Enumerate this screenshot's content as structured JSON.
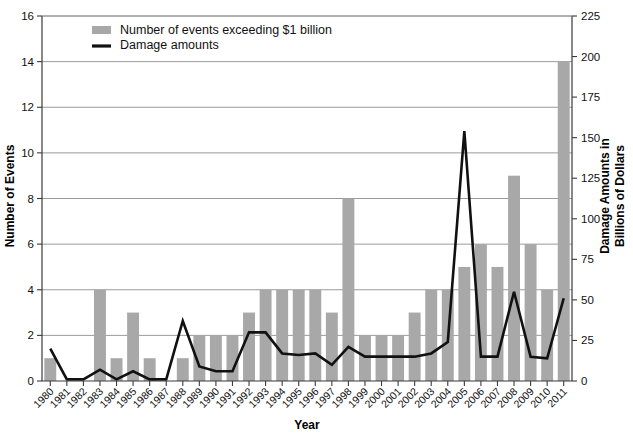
{
  "chart_data": {
    "type": "bar",
    "title": "",
    "subtitle": "",
    "xlabel": "Year",
    "ylabel": "Number of Events",
    "y2label": "Damage Amounts in Billions of Dollars",
    "grid": true,
    "legend_position": "top-left-inside",
    "ylim": [
      0,
      16
    ],
    "y2lim": [
      0,
      225
    ],
    "yticks": [
      0,
      2,
      4,
      6,
      8,
      10,
      12,
      14,
      16
    ],
    "y2ticks": [
      0,
      25,
      50,
      75,
      100,
      125,
      150,
      175,
      200,
      225
    ],
    "categories": [
      "1980",
      "1981",
      "1982",
      "1983",
      "1984",
      "1985",
      "1986",
      "1987",
      "1988",
      "1989",
      "1990",
      "1991",
      "1992",
      "1993",
      "1994",
      "1995",
      "1996",
      "1997",
      "1998",
      "1999",
      "2000",
      "2001",
      "2002",
      "2003",
      "2004",
      "2005",
      "2006",
      "2007",
      "2008",
      "2009",
      "2010",
      "2011"
    ],
    "series": [
      {
        "name": "Number of events exceeding $1 billion",
        "type": "bar",
        "axis": "left",
        "color": "#a8a8a8",
        "values": [
          1,
          0,
          0,
          4,
          1,
          3,
          1,
          0,
          1,
          2,
          2,
          2,
          3,
          4,
          4,
          4,
          4,
          3,
          8,
          2,
          2,
          2,
          3,
          4,
          4,
          5,
          6,
          5,
          9,
          6,
          4,
          14
        ]
      },
      {
        "name": "Damage amounts",
        "type": "line",
        "axis": "right",
        "color": "#111111",
        "values": [
          20,
          1,
          1,
          7,
          1,
          6,
          1,
          1,
          37,
          9,
          6,
          6,
          30,
          30,
          17,
          16,
          17,
          10,
          21,
          15,
          15,
          15,
          15,
          17,
          24,
          154,
          15,
          15,
          55,
          15,
          14,
          51
        ]
      }
    ]
  },
  "legend": {
    "items": [
      {
        "label": "Number of events exceeding $1 billion",
        "marker": "bar-swatch"
      },
      {
        "label": "Damage amounts",
        "marker": "line-swatch"
      }
    ]
  },
  "axes": {
    "x_title": "Year",
    "y_left_title": "Number of Events",
    "y_right_title_line1": "Damage Amounts in",
    "y_right_title_line2": "Billions of Dollars"
  }
}
